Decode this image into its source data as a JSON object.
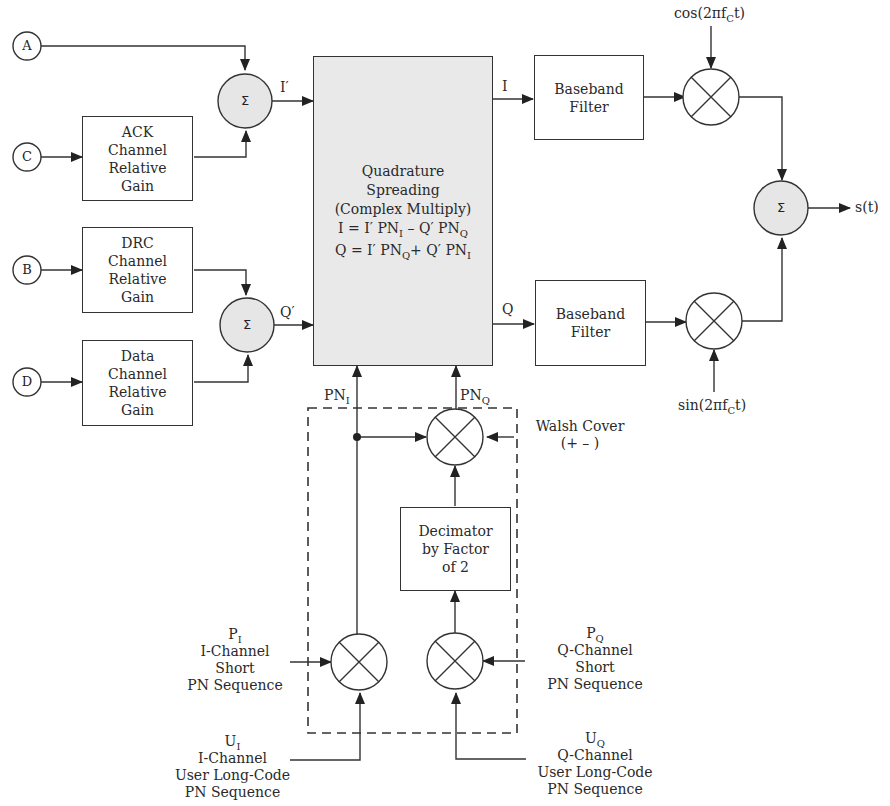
{
  "diagram": {
    "inputs": [
      {
        "id": "A",
        "label": "A"
      },
      {
        "id": "B",
        "label": "B"
      },
      {
        "id": "C",
        "label": "C"
      },
      {
        "id": "D",
        "label": "D"
      }
    ],
    "gain_blocks": [
      {
        "id": "ack",
        "lines": [
          "ACK",
          "Channel",
          "Relative",
          "Gain"
        ]
      },
      {
        "id": "drc",
        "lines": [
          "DRC",
          "Channel",
          "Relative",
          "Gain"
        ]
      },
      {
        "id": "data",
        "lines": [
          "Data",
          "Channel",
          "Relative",
          "Gain"
        ]
      }
    ],
    "summers": {
      "symbol": "Σ"
    },
    "signals": {
      "i_prime": "I′",
      "q_prime": "Q′",
      "i_out": "I",
      "q_out": "Q",
      "pn_i": {
        "base": "PN",
        "sub": "I"
      },
      "pn_q": {
        "base": "PN",
        "sub": "Q"
      },
      "output": "s(t)"
    },
    "spreader": {
      "lines": [
        "Quadrature",
        "Spreading",
        "(Complex Multiply)"
      ],
      "eq1": {
        "a": "I = I′ PN",
        "a_sub": "I",
        "b": " – Q′ PN",
        "b_sub": "Q"
      },
      "eq2": {
        "a": "Q = I′ PN",
        "a_sub": "Q",
        "b": "+ Q′ PN",
        "b_sub": "I"
      }
    },
    "filters": [
      {
        "id": "filter-i",
        "lines": [
          "Baseband",
          "Filter"
        ]
      },
      {
        "id": "filter-q",
        "lines": [
          "Baseband",
          "Filter"
        ]
      }
    ],
    "carriers": {
      "cos": {
        "pre": "cos(2πf",
        "sub": "C",
        "post": "t)"
      },
      "sin": {
        "pre": "sin(2πf",
        "sub": "C",
        "post": "t)"
      }
    },
    "walsh": {
      "line1": "Walsh Cover",
      "line2": "(+ – )"
    },
    "decimator": {
      "lines": [
        "Decimator",
        "by Factor",
        "of 2"
      ]
    },
    "pn_sources": {
      "pi": {
        "sym": "P",
        "sub": "I",
        "lines": [
          "I-Channel",
          "Short",
          "PN Sequence"
        ]
      },
      "pq": {
        "sym": "P",
        "sub": "Q",
        "lines": [
          "Q-Channel",
          "Short",
          "PN Sequence"
        ]
      },
      "ui": {
        "sym": "U",
        "sub": "I",
        "lines": [
          "I-Channel",
          "User Long-Code",
          "PN Sequence"
        ]
      },
      "uq": {
        "sym": "U",
        "sub": "Q",
        "lines": [
          "Q-Channel",
          "User Long-Code",
          "PN Sequence"
        ]
      }
    },
    "colors": {
      "line": "#333333",
      "summer_fill": "#e6e6e6",
      "spreader_fill": "#e9e9e9"
    }
  }
}
